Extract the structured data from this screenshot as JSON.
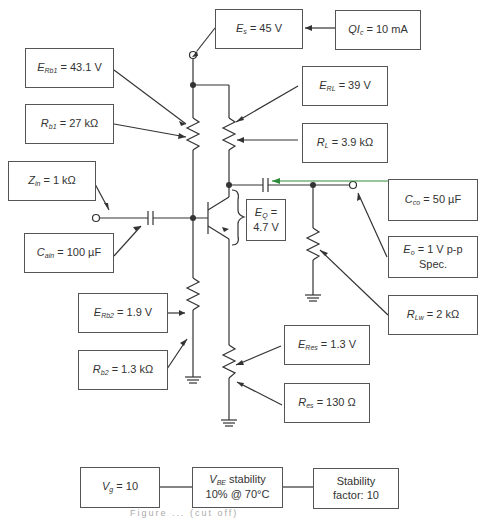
{
  "figure": {
    "caption_partial": "Figure ... (cut off)"
  },
  "boxes": {
    "es": {
      "sym": "E",
      "sub": "s",
      "value": "= 45 V"
    },
    "qic": {
      "sym": "QI",
      "sub": "c",
      "value": "= 10 mA"
    },
    "erb1": {
      "sym": "E",
      "sub": "Rb1",
      "value": "= 43.1 V"
    },
    "rb1": {
      "sym": "R",
      "sub": "b1",
      "value": "= 27 kΩ"
    },
    "erl": {
      "sym": "E",
      "sub": "RL",
      "value": "= 39 V"
    },
    "rl": {
      "sym": "R",
      "sub": "L",
      "value": "= 3.9 kΩ"
    },
    "zin": {
      "sym": "Z",
      "sub": "in",
      "value": "= 1 kΩ"
    },
    "cain": {
      "sym": "C",
      "sub": "ain",
      "value": "= 100 µF"
    },
    "eq": {
      "sym": "E",
      "sub": "Q",
      "value": "=",
      "line2": "4.7 V"
    },
    "cco": {
      "sym": "C",
      "sub": "co",
      "value": "= 50 µF"
    },
    "eo": {
      "sym": "E",
      "sub": "o",
      "value": "= 1 V p-p",
      "line2": "Spec."
    },
    "rlw": {
      "sym": "R",
      "sub": "Lw",
      "value": "= 2 kΩ"
    },
    "erb2": {
      "sym": "E",
      "sub": "Rb2",
      "value": "= 1.9 V"
    },
    "rb2": {
      "sym": "R",
      "sub": "b2",
      "value": "= 1.3 kΩ"
    },
    "eres": {
      "sym": "E",
      "sub": "Res",
      "value": "= 1.3 V"
    },
    "res": {
      "sym": "R",
      "sub": "es",
      "value": "= 130 Ω"
    },
    "vg": {
      "sym": "V",
      "sub": "g",
      "value": "= 10"
    },
    "vbe": {
      "sym": "V",
      "sub": "BE",
      "value": "stability",
      "line2": "10% @ 70°C"
    },
    "stab": {
      "line1": "Stability",
      "line2": "factor:  10"
    }
  },
  "colors": {
    "line": "#333333",
    "box_border": "#555555",
    "green_arrow": "#2e8b3a"
  }
}
